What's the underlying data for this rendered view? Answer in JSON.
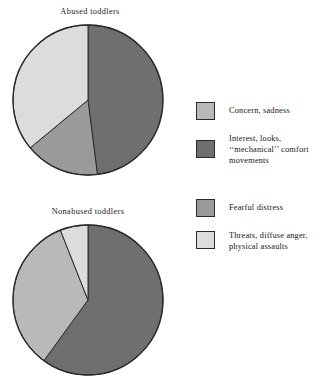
{
  "figure": {
    "background": "#ffffff",
    "outline_color": "#2a2a2a"
  },
  "colors": {
    "concern_sadness": "#b9b9b9",
    "interest_mechanical": "#6f6f6f",
    "fearful_distress": "#9a9a9a",
    "threats_anger_assaults": "#dcdcdc"
  },
  "legend": {
    "items": [
      {
        "key": "concern_sadness",
        "label": "Concern, sadness",
        "color": "#b9b9b9"
      },
      {
        "key": "interest_mechanical",
        "label": "Interest, looks,\n‘‘mechanical’’ comfort\nmovements",
        "color": "#6f6f6f"
      },
      {
        "key": "fearful_distress",
        "label": "Fearful distress",
        "color": "#9a9a9a"
      },
      {
        "key": "threats_anger_assaults",
        "label": "Threats, diffuse anger,\nphysical assaults",
        "color": "#dcdcdc"
      }
    ]
  },
  "chart_data": [
    {
      "type": "pie",
      "title": "Abused toddlers",
      "id": "abused",
      "start_angle_deg": 0,
      "direction": "clockwise",
      "categories": [
        "Interest, looks, ‘‘mechanical’’ comfort movements",
        "Fearful distress",
        "Threats, diffuse anger, physical assaults"
      ],
      "values": [
        48,
        16,
        36
      ],
      "colors": [
        "#6f6f6f",
        "#9a9a9a",
        "#dcdcdc"
      ],
      "units": "percent",
      "legend_position": "right"
    },
    {
      "type": "pie",
      "title": "Nonabused toddlers",
      "id": "nonabused",
      "start_angle_deg": 0,
      "direction": "clockwise",
      "categories": [
        "Interest, looks, ‘‘mechanical’’ comfort movements",
        "Concern, sadness",
        "Threats, diffuse anger, physical assaults"
      ],
      "values": [
        60,
        34,
        6
      ],
      "colors": [
        "#6f6f6f",
        "#b9b9b9",
        "#dcdcdc"
      ],
      "units": "percent",
      "legend_position": "right"
    }
  ]
}
